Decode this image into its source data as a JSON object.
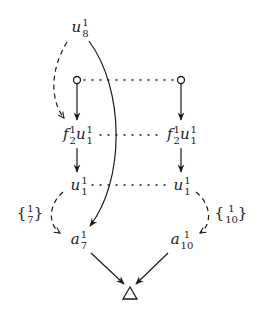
{
  "diagram": {
    "nodes": {
      "u8": {
        "base": "u",
        "sup": "1",
        "sub": "8"
      },
      "left_circle": {
        "shape": "open-circle"
      },
      "right_circle": {
        "shape": "open-circle"
      },
      "left_f2u1": {
        "f_base": "f",
        "f_sup": "1",
        "f_sub": "2",
        "u_base": "u",
        "u_sup": "1",
        "u_sub": "1"
      },
      "right_f2u1": {
        "f_base": "f",
        "f_sup": "1",
        "f_sub": "2",
        "u_base": "u",
        "u_sup": "1",
        "u_sub": "1"
      },
      "left_u1": {
        "base": "u",
        "sup": "1",
        "sub": "1"
      },
      "right_u1": {
        "base": "u",
        "sup": "1",
        "sub": "1"
      },
      "a7": {
        "base": "a",
        "sup": "1",
        "sub": "7"
      },
      "a10": {
        "base": "a",
        "sup": "1",
        "sub": "10"
      },
      "sink": {
        "shape": "open-triangle"
      }
    },
    "edge_labels": {
      "left": {
        "open": "{",
        "num": "1",
        "den": "7",
        "close": "}"
      },
      "right": {
        "open": "{",
        "num": "1",
        "den": "10",
        "close": "}"
      }
    },
    "edges": [
      {
        "from": "u8",
        "to": "left_f2u1",
        "style": "dashed"
      },
      {
        "from": "u8",
        "to": "a7",
        "style": "solid-curve"
      },
      {
        "from": "left_circle",
        "to": "left_f2u1",
        "style": "solid"
      },
      {
        "from": "right_circle",
        "to": "right_f2u1",
        "style": "solid"
      },
      {
        "from": "left_f2u1",
        "to": "left_u1",
        "style": "solid"
      },
      {
        "from": "right_f2u1",
        "to": "right_u1",
        "style": "solid"
      },
      {
        "from": "left_u1",
        "to": "a7",
        "style": "dashed",
        "label": "{1/7}"
      },
      {
        "from": "right_u1",
        "to": "a10",
        "style": "dashed",
        "label": "{1/10}"
      },
      {
        "from": "a7",
        "to": "sink",
        "style": "solid"
      },
      {
        "from": "a10",
        "to": "sink",
        "style": "solid"
      },
      {
        "from": "left_circle",
        "to": "right_circle",
        "style": "dotted"
      },
      {
        "from": "left_f2u1",
        "to": "right_f2u1",
        "style": "dotted"
      },
      {
        "from": "left_u1",
        "to": "right_u1",
        "style": "dotted"
      }
    ],
    "colors": {
      "ink": "#1a1a1a",
      "background": "#ffffff"
    }
  }
}
